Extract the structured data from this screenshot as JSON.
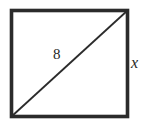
{
  "figure": {
    "kind": "square-with-diagonal",
    "background_color": "#ffffff",
    "stroke_color": "#2b2b2b",
    "square": {
      "name": "square-outline",
      "left": 11.5,
      "top": 10.5,
      "right": 127.5,
      "bottom": 116.5,
      "stroke_width": 3.6
    },
    "diagonal": {
      "name": "diagonal-line",
      "from_x": 11.5,
      "from_y": 116.5,
      "to_x": 127.5,
      "to_y": 10.5,
      "stroke_width": 1.8
    },
    "labels": {
      "diagonal_length": "8",
      "side_length": "x"
    }
  }
}
